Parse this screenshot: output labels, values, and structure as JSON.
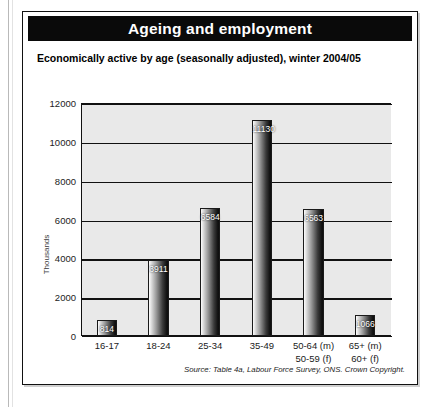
{
  "figure": {
    "title": "Ageing and employment",
    "subtitle": "Economically active by age (seasonally adjusted), winter 2004/05",
    "source": "Source: Table 4a, Labour Force Survey, ONS. Crown Copyright.",
    "colors": {
      "title_bar_background": "#0a0a0a",
      "title_text": "#ffffff",
      "plot_background": "#e9e9e9",
      "gridline": "#111111",
      "bar_dark": "#141414",
      "bar_light": "#fdfdfd",
      "frame_border": "#111111"
    }
  },
  "chart_data": {
    "type": "bar",
    "title": "Economically active by age (seasonally adjusted), winter 2004/05",
    "xlabel": "",
    "ylabel": "Thousands",
    "categories": [
      "16-17",
      "18-24",
      "25-34",
      "35-49",
      "50-64 (m)\n50-59 (f)",
      "65+ (m)\n60+ (f)"
    ],
    "category_lines": [
      [
        "16-17"
      ],
      [
        "18-24"
      ],
      [
        "25-34"
      ],
      [
        "35-49"
      ],
      [
        "50-64 (m)",
        "50-59 (f)"
      ],
      [
        "65+ (m)",
        "60+ (f)"
      ]
    ],
    "values": [
      814,
      3911,
      6584,
      11130,
      6563,
      1066
    ],
    "value_labels": [
      "814",
      "3911",
      "6584",
      "11130",
      "6563",
      "1066"
    ],
    "ylim": [
      0,
      12000
    ],
    "yticks": [
      0,
      2000,
      4000,
      6000,
      8000,
      10000,
      12000
    ],
    "ytick_labels": [
      "0",
      "2000",
      "4000",
      "6000",
      "8000",
      "10000",
      "12000"
    ],
    "grid": true,
    "grid_axis": "y",
    "legend": false
  }
}
